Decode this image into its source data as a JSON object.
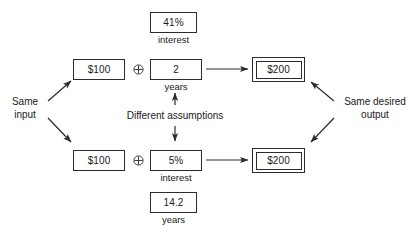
{
  "diagram": {
    "nodes": {
      "top_rate": {
        "value": "41%",
        "caption": "interest"
      },
      "top_principal": {
        "value": "$100"
      },
      "top_term": {
        "value": "2",
        "caption": "years"
      },
      "top_result": {
        "value": "$200"
      },
      "bottom_principal": {
        "value": "$100"
      },
      "bottom_rate": {
        "value": "5%",
        "caption": "interest"
      },
      "bottom_result": {
        "value": "$200"
      },
      "bottom_term": {
        "value": "14.2",
        "caption": "years"
      }
    },
    "labels": {
      "input": "Same\ninput",
      "input_line1": "Same",
      "input_line2": "input",
      "output_line1": "Same desired",
      "output_line2": "output",
      "assumptions": "Different assumptions"
    },
    "operators": {
      "combine": "circled-plus"
    },
    "colors": {
      "stroke": "#2b2b2b",
      "text": "#1a1a1a",
      "background": "#ffffff"
    }
  }
}
